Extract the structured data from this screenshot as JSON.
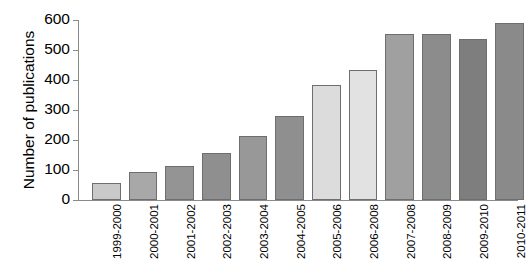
{
  "chart_data": {
    "type": "bar",
    "title": "",
    "xlabel": "",
    "ylabel": "Number of publications",
    "categories": [
      "1999-2000",
      "2000-2001",
      "2001-2002",
      "2002-2003",
      "2003-2004",
      "2004-2005",
      "2005-2006",
      "2006-2008",
      "2007-2008",
      "2008-2009",
      "2009-2010",
      "2010-2011"
    ],
    "values": [
      58,
      93,
      113,
      158,
      212,
      280,
      383,
      435,
      555,
      553,
      537,
      590
    ],
    "bar_colors": [
      "#c9c9c9",
      "#a8a8a8",
      "#949494",
      "#8f8f8f",
      "#989898",
      "#8f8f8f",
      "#dcdcdc",
      "#e2e2e2",
      "#a0a0a0",
      "#8c8c8c",
      "#7e7e7e",
      "#8a8a8a"
    ],
    "ylim": [
      0,
      600
    ],
    "yticks": [
      0,
      100,
      200,
      300,
      400,
      500,
      600
    ],
    "ytick_labels": [
      "0",
      "100",
      "200",
      "300",
      "400",
      "500",
      "600"
    ],
    "grid": false,
    "legend": null,
    "axis_color": "#8a8a8a",
    "bar_edge_color": "#6e6e6e"
  }
}
